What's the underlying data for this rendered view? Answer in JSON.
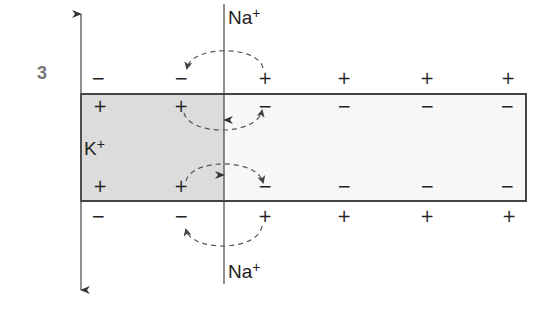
{
  "figure": {
    "step_number": "3",
    "labels": {
      "na_top": {
        "base": "Na",
        "sup": "+"
      },
      "na_bottom": {
        "base": "Na",
        "sup": "+"
      },
      "k_inside": {
        "base": "K",
        "sup": "+"
      }
    },
    "colors": {
      "depolarized_region_fill": "#dcdcdc",
      "resting_region_fill": "#f7f7f7",
      "line": "#333333",
      "dashed_arrow": "#555555",
      "step_number": "#777777"
    },
    "charge_rows": {
      "outside_top": [
        "−",
        "−",
        "+",
        "+",
        "+",
        "+"
      ],
      "inside_top": [
        "+",
        "+",
        "−",
        "−",
        "−",
        "−"
      ],
      "inside_bottom": [
        "+",
        "+",
        "−",
        "−",
        "−",
        "−"
      ],
      "outside_bottom": [
        "−",
        "−",
        "+",
        "+",
        "+",
        "+"
      ]
    },
    "charge_columns_x": [
      98,
      181,
      265,
      344,
      427,
      508
    ]
  }
}
